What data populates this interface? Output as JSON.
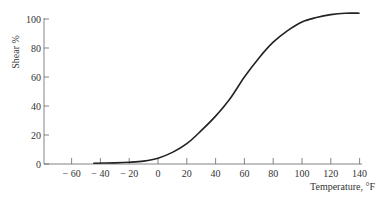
{
  "chart_data": {
    "type": "line",
    "title": "",
    "xlabel": "Temperature, °F",
    "ylabel": "Shear %",
    "xlim": [
      -70,
      150
    ],
    "ylim": [
      0,
      100
    ],
    "x_ticks": [
      -60,
      -40,
      -20,
      0,
      20,
      40,
      60,
      80,
      100,
      120,
      140
    ],
    "x_tick_labels": [
      "− 60",
      "− 40",
      "− 20",
      "0",
      "20",
      "40",
      "60",
      "80",
      "100",
      "120",
      "140"
    ],
    "y_ticks": [
      0,
      20,
      40,
      60,
      80,
      100
    ],
    "y_tick_labels": [
      "0",
      "20",
      "40",
      "60",
      "80",
      "100"
    ],
    "grid": false,
    "legend": null,
    "series": [
      {
        "name": "Shear %",
        "x": [
          -45,
          -30,
          -20,
          -10,
          0,
          10,
          20,
          30,
          40,
          50,
          60,
          70,
          80,
          90,
          100,
          110,
          120,
          130,
          140
        ],
        "values": [
          0.5,
          0.8,
          1.2,
          2.0,
          4,
          8,
          14,
          23,
          33,
          45,
          60,
          73,
          84,
          92,
          98,
          101,
          103,
          104,
          104
        ]
      }
    ]
  }
}
